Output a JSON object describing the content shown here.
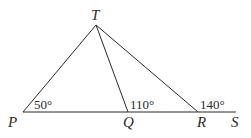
{
  "diagram": {
    "points": {
      "T": {
        "label": "T",
        "x": 96,
        "y": 25
      },
      "P": {
        "label": "P",
        "x": 23,
        "y": 112
      },
      "Q": {
        "label": "Q",
        "x": 128,
        "y": 112
      },
      "R": {
        "label": "R",
        "x": 198,
        "y": 112
      },
      "S": {
        "label": "S",
        "x": 236,
        "y": 112
      }
    },
    "segments": [
      {
        "from": "P",
        "to": "S",
        "name": "baseline-PS"
      },
      {
        "from": "T",
        "to": "P",
        "name": "segment-TP"
      },
      {
        "from": "T",
        "to": "Q",
        "name": "segment-TQ"
      },
      {
        "from": "T",
        "to": "R",
        "name": "segment-TR"
      }
    ],
    "angles": {
      "at_P": "50°",
      "at_Q": "110°",
      "at_R": "140°"
    },
    "line_color": "#2b2b2b"
  }
}
